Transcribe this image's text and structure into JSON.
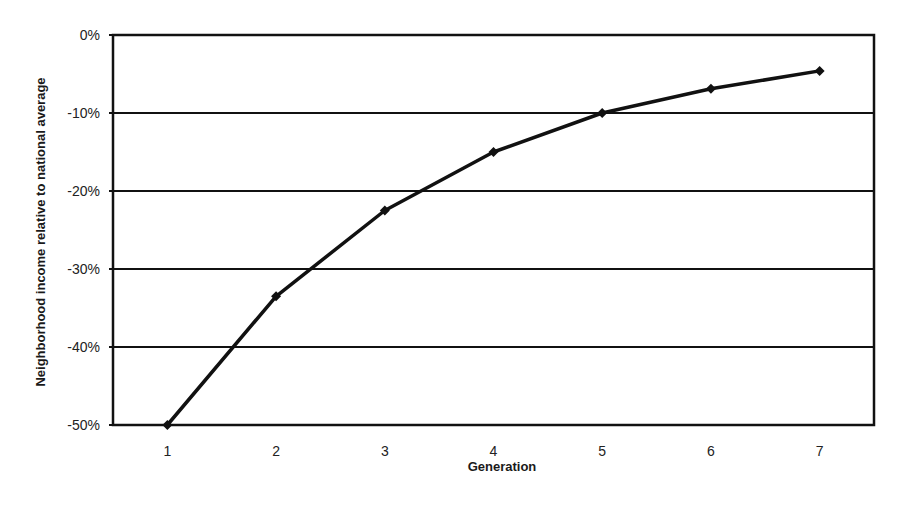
{
  "chart_data": {
    "type": "line",
    "title": "",
    "xlabel": "Generation",
    "ylabel": "Neighborhood income relative to national average",
    "categories": [
      "1",
      "2",
      "3",
      "4",
      "5",
      "6",
      "7"
    ],
    "x": [
      1,
      2,
      3,
      4,
      5,
      6,
      7
    ],
    "series": [
      {
        "name": "Neighborhood income relative to national average",
        "values": [
          -50,
          -33.5,
          -22.5,
          -15,
          -10,
          -6.9,
          -4.6
        ],
        "color": "#111111",
        "marker": "diamond"
      }
    ],
    "yticks": [
      "0%",
      "-10%",
      "-20%",
      "-30%",
      "-40%",
      "-50%"
    ],
    "ytick_values": [
      0,
      -10,
      -20,
      -30,
      -40,
      -50
    ],
    "ylim": [
      -50,
      0
    ],
    "grid": true,
    "legend": "none"
  }
}
